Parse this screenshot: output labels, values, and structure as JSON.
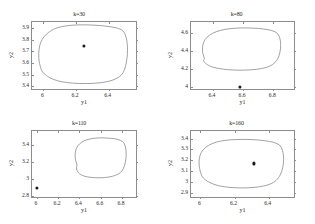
{
  "figure": {
    "background_color": "#ffffff",
    "axis_color": "#8d8d8d",
    "marker_color": "#1a1a1a",
    "contour_color": "#7a7a7a",
    "panel_count": 4
  },
  "chart_data": [
    {
      "type": "line",
      "title": "k=30",
      "xlabel": "y1",
      "ylabel": "y2",
      "xlim": [
        5.93,
        6.58
      ],
      "ylim": [
        3.36,
        3.95
      ],
      "xticks": [
        6,
        6.2,
        6.4
      ],
      "xticklabels": [
        "6",
        "6.2",
        "6.4"
      ],
      "yticks": [
        3.4,
        3.5,
        3.6,
        3.7,
        3.8,
        3.9
      ],
      "yticklabels": [
        "3.4",
        "3.5",
        "3.6",
        "3.7",
        "3.8",
        "3.9"
      ],
      "grid": false,
      "legend": "none",
      "series": [
        {
          "name": "confidence-contour",
          "closed": true,
          "x": [
            5.985,
            5.975,
            5.972,
            5.978,
            5.995,
            6.03,
            6.08,
            6.15,
            6.24,
            6.33,
            6.41,
            6.47,
            6.505,
            6.522,
            6.527,
            6.524,
            6.515,
            6.5,
            6.47,
            6.42,
            6.35,
            6.27,
            6.19,
            6.12,
            6.06,
            6.02,
            5.998,
            5.988
          ],
          "y": [
            3.545,
            3.6,
            3.67,
            3.74,
            3.8,
            3.855,
            3.895,
            3.917,
            3.925,
            3.921,
            3.91,
            3.893,
            3.86,
            3.79,
            3.71,
            3.635,
            3.565,
            3.505,
            3.462,
            3.432,
            3.414,
            3.408,
            3.411,
            3.423,
            3.447,
            3.478,
            3.508,
            3.528
          ]
        }
      ],
      "markers": [
        {
          "name": "center-point",
          "x": 6.248,
          "y": 3.748
        }
      ]
    },
    {
      "type": "line",
      "title": "k=80",
      "xlabel": "y1",
      "ylabel": "y2",
      "xlim": [
        6.255,
        6.95
      ],
      "ylim": [
        3.955,
        4.72
      ],
      "xticks": [
        6.4,
        6.6,
        6.8
      ],
      "xticklabels": [
        "6.4",
        "6.6",
        "6.8"
      ],
      "yticks": [
        4,
        4.2,
        4.4,
        4.6
      ],
      "yticklabels": [
        "4",
        "4.2",
        "4.4",
        "4.6"
      ],
      "grid": false,
      "legend": "none",
      "series": [
        {
          "name": "confidence-contour",
          "closed": true,
          "x": [
            6.345,
            6.335,
            6.333,
            6.341,
            6.362,
            6.4,
            6.455,
            6.525,
            6.6,
            6.675,
            6.745,
            6.8,
            6.838,
            6.856,
            6.86,
            6.855,
            6.843,
            6.82,
            6.785,
            6.73,
            6.66,
            6.585,
            6.51,
            6.44,
            6.385,
            6.352,
            6.34
          ],
          "y": [
            4.305,
            4.36,
            4.425,
            4.49,
            4.545,
            4.59,
            4.625,
            4.645,
            4.652,
            4.65,
            4.64,
            4.622,
            4.59,
            4.525,
            4.45,
            4.375,
            4.31,
            4.255,
            4.215,
            4.188,
            4.174,
            4.17,
            4.175,
            4.19,
            4.215,
            4.25,
            4.28
          ]
        }
      ],
      "markers": [
        {
          "name": "center-point",
          "x": 6.578,
          "y": 3.998
        }
      ]
    },
    {
      "type": "line",
      "title": "k=110",
      "xlabel": "y1",
      "ylabel": "y2",
      "xlim": [
        5.955,
        6.95
      ],
      "ylim": [
        2.77,
        3.56
      ],
      "xticks": [
        6,
        6.2,
        6.4,
        6.6,
        6.8
      ],
      "xticklabels": [
        "6",
        "6.2",
        "6.4",
        "6.6",
        "6.8"
      ],
      "yticks": [
        2.8,
        3,
        3.2,
        3.4
      ],
      "yticklabels": [
        "2.8",
        "3",
        "3.2",
        "3.4"
      ],
      "grid": false,
      "legend": "none",
      "series": [
        {
          "name": "confidence-contour",
          "closed": true,
          "x": [
            6.385,
            6.372,
            6.368,
            6.375,
            6.395,
            6.43,
            6.48,
            6.545,
            6.615,
            6.685,
            6.75,
            6.8,
            6.835,
            6.852,
            6.856,
            6.85,
            6.837,
            6.815,
            6.78,
            6.725,
            6.66,
            6.59,
            6.52,
            6.455,
            6.41,
            6.388,
            6.38
          ],
          "y": [
            3.155,
            3.21,
            3.275,
            3.335,
            3.385,
            3.425,
            3.455,
            3.472,
            3.478,
            3.475,
            3.466,
            3.448,
            3.415,
            3.35,
            3.275,
            3.2,
            3.135,
            3.082,
            3.044,
            3.018,
            3.004,
            3.0,
            3.005,
            3.02,
            3.048,
            3.085,
            3.12
          ]
        }
      ],
      "markers": [
        {
          "name": "center-point",
          "x": 6.002,
          "y": 2.895
        }
      ]
    },
    {
      "type": "line",
      "title": "k=160",
      "xlabel": "y1",
      "ylabel": "y2",
      "xlim": [
        5.945,
        6.56
      ],
      "ylim": [
        2.845,
        3.47
      ],
      "xticks": [
        6,
        6.2,
        6.4
      ],
      "xticklabels": [
        "6",
        "6.2",
        "6.4"
      ],
      "yticks": [
        2.9,
        3,
        3.1,
        3.2,
        3.3,
        3.4
      ],
      "yticklabels": [
        "2.9",
        "3",
        "3.1",
        "3.2",
        "3.3",
        "3.4"
      ],
      "grid": false,
      "legend": "none",
      "series": [
        {
          "name": "confidence-contour",
          "closed": true,
          "x": [
            6.005,
            5.996,
            5.993,
            5.999,
            6.016,
            6.049,
            6.097,
            6.162,
            6.238,
            6.315,
            6.385,
            6.44,
            6.477,
            6.494,
            6.498,
            6.493,
            6.481,
            6.46,
            6.428,
            6.378,
            6.315,
            6.245,
            6.178,
            6.115,
            6.065,
            6.03,
            6.012
          ],
          "y": [
            3.065,
            3.118,
            3.178,
            3.238,
            3.29,
            3.333,
            3.365,
            3.384,
            3.39,
            3.388,
            3.378,
            3.361,
            3.33,
            3.268,
            3.197,
            3.127,
            3.065,
            3.013,
            2.975,
            2.949,
            2.935,
            2.931,
            2.936,
            2.95,
            2.976,
            3.008,
            3.04
          ]
        }
      ],
      "markers": [
        {
          "name": "center-point",
          "x": 6.312,
          "y": 3.172
        }
      ]
    }
  ]
}
